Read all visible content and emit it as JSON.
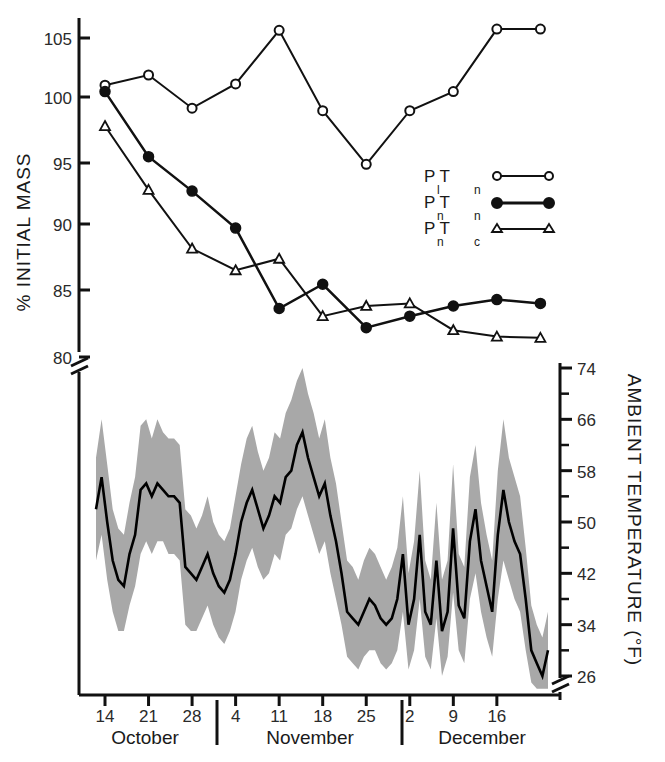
{
  "chart_data": {
    "type": "line",
    "title": "",
    "panels": [
      {
        "name": "mass-panel",
        "ylabel": "% INITIAL MASS",
        "ylim": [
          78.5,
          107
        ],
        "yticks": [
          80,
          85,
          90,
          95,
          100,
          105
        ],
        "axis_break": true,
        "grid": false,
        "legend_position": "inside-right",
        "series": [
          {
            "name": "Pl Tn",
            "label_main": "P T",
            "label_sub_1": "l",
            "label_sub_2": "n",
            "marker": "open-circle",
            "x": [
              14,
              21,
              28,
              35,
              42,
              49,
              56,
              63,
              70,
              77,
              84
            ],
            "x_labels": [
              "Oct 14",
              "Oct 21",
              "Oct 28",
              "Nov 4",
              "Nov 11",
              "Nov 18",
              "Nov 25",
              "Dec 2",
              "Dec 9",
              "Dec 16",
              "Dec 23"
            ],
            "values": [
              101.3,
              102.1,
              99.5,
              101.4,
              105.6,
              99.3,
              95.1,
              99.3,
              100.8,
              105.7,
              105.7
            ]
          },
          {
            "name": "Pn Tn",
            "label_main": "P T",
            "label_sub_1": "n",
            "label_sub_2": "n",
            "marker": "filled-circle",
            "x": [
              14,
              21,
              28,
              35,
              42,
              49,
              56,
              63,
              70,
              77,
              84
            ],
            "x_labels": [
              "Oct 14",
              "Oct 21",
              "Oct 28",
              "Nov 4",
              "Nov 11",
              "Nov 18",
              "Nov 25",
              "Dec 2",
              "Dec 9",
              "Dec 16",
              "Dec 23"
            ],
            "values": [
              100.8,
              95.7,
              93.0,
              90.1,
              83.8,
              85.7,
              82.3,
              83.2,
              84.0,
              84.5,
              84.2
            ]
          },
          {
            "name": "Pn Tc",
            "label_main": "P T",
            "label_sub_1": "n",
            "label_sub_2": "c",
            "marker": "open-triangle",
            "x": [
              14,
              21,
              28,
              35,
              42,
              49,
              56,
              63,
              70,
              77,
              84
            ],
            "x_labels": [
              "Oct 14",
              "Oct 21",
              "Oct 28",
              "Nov 4",
              "Nov 11",
              "Nov 18",
              "Nov 25",
              "Dec 2",
              "Dec 9",
              "Dec 16",
              "Dec 23"
            ],
            "values": [
              98.1,
              93.1,
              88.5,
              86.8,
              87.7,
              83.2,
              84.0,
              84.2,
              82.1,
              81.6,
              81.5
            ]
          }
        ],
        "series_extra": {
          "pn_tn_tail": [
            84.5,
            84.2,
            81.4
          ],
          "pn_tc_tail": [
            81.6,
            81.5,
            81.4
          ]
        }
      },
      {
        "name": "temperature-panel",
        "ylabel": "AMBIENT TEMPERATURE (°F)",
        "ylim": [
          24,
          74
        ],
        "yticks": [
          26,
          34,
          42,
          50,
          58,
          66,
          74
        ],
        "minor_ticks": [
          30,
          38,
          46,
          54,
          62,
          70
        ],
        "axis_break": true,
        "grid": false,
        "band_label": "daily min-max range",
        "mean_label": "daily mean",
        "band_color": "#a8a8a8",
        "line_color": "#000000",
        "mean": [
          52,
          57,
          50,
          44,
          41,
          40,
          45,
          48,
          55,
          56,
          54,
          56,
          55,
          54,
          54,
          53,
          43,
          42,
          41,
          43,
          45,
          42,
          40,
          39,
          41,
          45,
          50,
          53,
          55,
          52,
          49,
          51,
          54,
          53,
          57,
          58,
          62,
          64,
          60,
          57,
          54,
          56,
          51,
          47,
          42,
          36,
          35,
          34,
          36,
          38,
          37,
          35,
          34,
          35,
          38,
          45,
          34,
          38,
          48,
          36,
          34,
          44,
          33,
          36,
          49,
          37,
          35,
          47,
          52,
          44,
          40,
          36,
          48,
          55,
          50,
          47,
          45,
          38,
          30,
          28,
          26,
          30
        ],
        "min": [
          44,
          48,
          41,
          36,
          33,
          33,
          37,
          40,
          45,
          47,
          45,
          47,
          47,
          45,
          45,
          44,
          34,
          33,
          33,
          35,
          37,
          34,
          32,
          31,
          33,
          36,
          41,
          44,
          46,
          43,
          41,
          42,
          45,
          44,
          48,
          49,
          52,
          54,
          51,
          48,
          45,
          47,
          42,
          38,
          34,
          29,
          28,
          27,
          29,
          30,
          30,
          28,
          27,
          28,
          30,
          36,
          27,
          30,
          38,
          29,
          27,
          35,
          26,
          29,
          39,
          30,
          28,
          38,
          42,
          36,
          32,
          29,
          38,
          44,
          41,
          38,
          36,
          30,
          25,
          24,
          24,
          24
        ],
        "max": [
          60,
          66,
          59,
          52,
          49,
          48,
          53,
          57,
          65,
          66,
          63,
          66,
          64,
          63,
          63,
          62,
          52,
          51,
          49,
          51,
          54,
          50,
          48,
          47,
          49,
          54,
          59,
          63,
          65,
          61,
          58,
          60,
          64,
          63,
          67,
          69,
          72,
          74,
          70,
          67,
          63,
          66,
          60,
          56,
          50,
          44,
          43,
          41,
          44,
          46,
          45,
          43,
          41,
          43,
          46,
          54,
          42,
          47,
          58,
          44,
          41,
          53,
          41,
          44,
          59,
          45,
          43,
          57,
          62,
          53,
          48,
          44,
          58,
          66,
          60,
          57,
          54,
          46,
          37,
          34,
          32,
          36
        ]
      }
    ],
    "xaxis": {
      "label": "",
      "tick_values": [
        14,
        21,
        28,
        4,
        11,
        18,
        25,
        2,
        9,
        16
      ],
      "tick_labels": [
        "14",
        "21",
        "28",
        "4",
        "11",
        "18",
        "25",
        "2",
        "9",
        "16"
      ],
      "months": [
        {
          "label": "October",
          "start_day": 11,
          "end_day": 31
        },
        {
          "label": "November",
          "start_day": 1,
          "end_day": 30
        },
        {
          "label": "December",
          "start_day": 1,
          "end_day": 21
        }
      ]
    }
  }
}
